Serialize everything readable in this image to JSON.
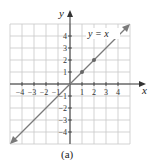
{
  "chart_data": {
    "type": "line",
    "title": "",
    "xlabel": "x",
    "ylabel": "y",
    "xlim": [
      -5,
      5
    ],
    "ylim": [
      -5,
      5
    ],
    "grid": true,
    "x_ticks": [
      -4,
      -3,
      -2,
      -1,
      1,
      2,
      3,
      4
    ],
    "y_ticks": [
      -4,
      -3,
      -2,
      -1,
      1,
      2,
      3,
      4
    ],
    "series": [
      {
        "name": "y = x",
        "equation": "y = x",
        "x": [
          -5,
          5
        ],
        "y": [
          -5,
          5
        ],
        "arrows_both_ends": true
      }
    ],
    "points": [
      {
        "x": 1,
        "y": 1
      },
      {
        "x": 2,
        "y": 2
      }
    ],
    "annotations": [
      {
        "text": "y = x",
        "position": "upper-right"
      }
    ],
    "caption": "(a)"
  },
  "labels": {
    "x_axis": "x",
    "y_axis": "y",
    "equation": "y = x",
    "caption": "(a)",
    "x_ticks": [
      "−4",
      "−3",
      "−2",
      "−1",
      "1",
      "2",
      "3",
      "4"
    ],
    "y_ticks": [
      "4",
      "3",
      "2",
      "1",
      "−1",
      "−2",
      "−3",
      "−4"
    ]
  },
  "colors": {
    "grid": "#c8c8c8",
    "axis": "#333333",
    "line": "#7a7a7a",
    "point": "#666666"
  }
}
